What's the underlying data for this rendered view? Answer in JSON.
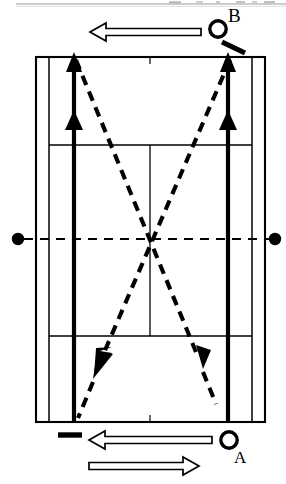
{
  "page": {
    "background_color": "#ffffff",
    "ink_color": "#000000",
    "width": 286,
    "height": 484
  },
  "labels": {
    "player_b": "B",
    "player_a": "A"
  },
  "players": [
    {
      "id": "player-b",
      "label": "B",
      "icon": "player-circle-icon",
      "position": {
        "x": 218,
        "y": 29,
        "radius": 8
      },
      "label_position": {
        "x": 228,
        "y": 6
      },
      "side": "far-court-rear-right",
      "has_racket": true,
      "racket_icon": "racket-stroke-icon"
    },
    {
      "id": "player-a",
      "label": "A",
      "icon": "player-circle-icon",
      "position": {
        "x": 229,
        "y": 440,
        "radius": 8
      },
      "label_position": {
        "x": 234,
        "y": 449
      },
      "side": "near-court-rear-right",
      "has_racket": false,
      "racket_icon": null
    }
  ],
  "court": {
    "name": "badminton-doubles-court",
    "outer_left": 36,
    "outer_right": 265,
    "outer_top": 57,
    "outer_bottom": 422,
    "singles_sideline_left": 49,
    "singles_sideline_right": 252,
    "doubles_long_service_left": 74,
    "doubles_long_service_right": 228,
    "short_service_line_top_y": 145,
    "short_service_line_bottom_y": 336,
    "centre_line_x": 150,
    "net_line_y": 239,
    "net_post_left": {
      "x": 18,
      "y": 239,
      "radius": 6
    },
    "net_post_right": {
      "x": 275,
      "y": 239,
      "radius": 6
    },
    "thin_line_width": 1.6,
    "thick_line_width": 2.4
  },
  "shuttle_paths": [
    {
      "id": "path-b-right-to-a-left",
      "style": "dashed",
      "from": {
        "x": 230,
        "y": 60
      },
      "to": {
        "x": 78,
        "y": 416
      },
      "arrowhead_at": "to",
      "description": "Dashed shuttle trajectory from B rear right corner crosscourt to near left rear corner"
    },
    {
      "id": "path-b-left-to-a-right",
      "style": "dashed",
      "from": {
        "x": 76,
        "y": 60
      },
      "to": {
        "x": 215,
        "y": 386
      },
      "arrowhead_at": "to",
      "description": "Dashed shuttle trajectory from far left rear corner crosscourt to near right side"
    }
  ],
  "movement_arrows": [
    {
      "id": "arrow-left-sideline-up",
      "style": "solid-thick",
      "x": 74,
      "from_y": 422,
      "to_y": 57,
      "arrowheads": [
        {
          "y": 60,
          "direction": "up"
        },
        {
          "y": 112,
          "direction": "up"
        }
      ],
      "description": "Solid thick recovery arrow up the left doubles long service line"
    },
    {
      "id": "arrow-right-sideline-up",
      "style": "solid-thick",
      "x": 228,
      "from_y": 422,
      "to_y": 57,
      "arrowheads": [
        {
          "y": 60,
          "direction": "up"
        },
        {
          "y": 112,
          "direction": "up"
        }
      ],
      "description": "Solid thick recovery arrow up the right doubles long service line"
    }
  ],
  "hollow_arrows": [
    {
      "id": "top-hollow-arrow-left",
      "direction": "left",
      "tail": {
        "x": 201,
        "y": 32
      },
      "tip": {
        "x": 90,
        "y": 32
      },
      "fill": "#ffffff",
      "stroke": "#000000",
      "description": "Hollow outline arrow above court pointing left"
    },
    {
      "id": "bottom-hollow-arrow-left",
      "direction": "left",
      "tail": {
        "x": 212,
        "y": 440
      },
      "tip": {
        "x": 89,
        "y": 440
      },
      "fill": "#ffffff",
      "stroke": "#000000",
      "description": "Hollow outline arrow below court pointing left"
    },
    {
      "id": "bottom-hollow-arrow-right",
      "direction": "right",
      "tail": {
        "x": 89,
        "y": 466
      },
      "tip": {
        "x": 199,
        "y": 466
      },
      "fill": "#ffffff",
      "stroke": "#000000",
      "description": "Hollow outline arrow below court pointing right"
    }
  ],
  "dash_markers": [
    {
      "id": "racket-stroke-b",
      "x1": 223,
      "y1": 43,
      "x2": 244,
      "y2": 53,
      "width": 5,
      "description": "Short thick diagonal stroke representing player B racket"
    },
    {
      "id": "dash-marker-bottom-left",
      "x1": 58,
      "y1": 435,
      "x2": 82,
      "y2": 435,
      "width": 5,
      "description": "Short thick horizontal dash marker near near-court left rear corner"
    }
  ],
  "page_edge_rule": {
    "id": "top-page-rule",
    "y": 4,
    "x1": 16,
    "x2": 286,
    "width": 1,
    "color": "#9a9a9a",
    "description": "Faint horizontal scan rule along the top page edge"
  }
}
